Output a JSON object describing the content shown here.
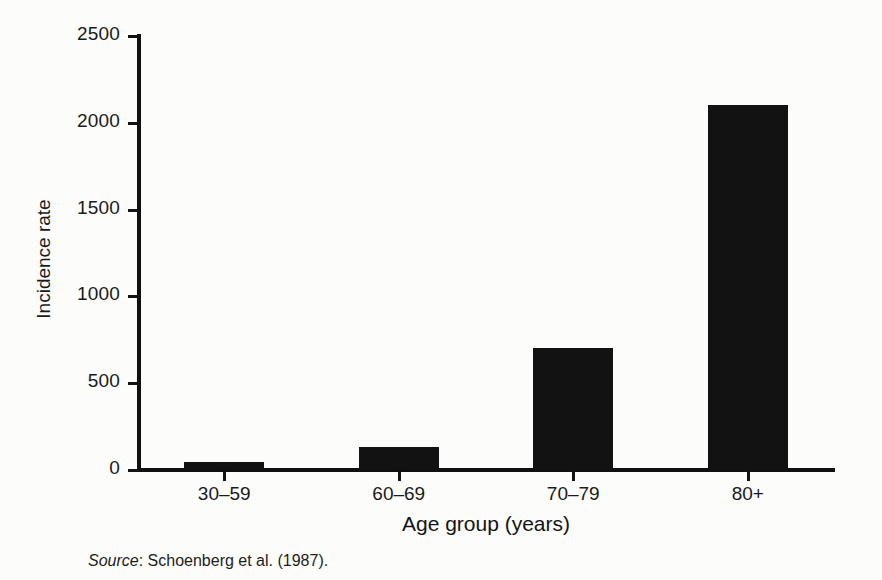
{
  "figure": {
    "background_color": "#fcfcfa",
    "ink_color": "#131212",
    "source_label": "Source",
    "source_separator": ": ",
    "source_text": "Schoenberg et al. (1987)."
  },
  "chart_data": {
    "type": "bar",
    "title": "",
    "xlabel": "Age group (years)",
    "ylabel": "Incidence rate",
    "categories": [
      "30–59",
      "60–69",
      "70–79",
      "80+"
    ],
    "values": [
      45,
      130,
      700,
      2100
    ],
    "ylim": [
      0,
      2500
    ],
    "yticks": [
      0,
      500,
      1000,
      1500,
      2000,
      2500
    ],
    "ytick_labels": [
      "0",
      "500",
      "1000",
      "1500",
      "2000",
      "2500"
    ],
    "grid": false,
    "legend": null,
    "bar_color": "#131212",
    "orientation": "vertical"
  }
}
